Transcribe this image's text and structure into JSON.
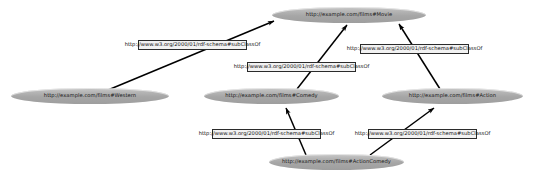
{
  "diagram": {
    "type": "directed-graph",
    "background_color": "#ffffff",
    "node_fill_color": "#a8a8a8",
    "node_text_color": "#1a1a1a",
    "edge_color": "#000000",
    "edge_label_fill": "#f2f2f2",
    "edge_label_border": "#2b2b2b",
    "nodes": [
      {
        "id": "movie",
        "label": "http://example.com/films#Movie"
      },
      {
        "id": "western",
        "label": "http://example.com/films#Western"
      },
      {
        "id": "comedy",
        "label": "http://example.com/films#Comedy"
      },
      {
        "id": "action",
        "label": "http://example.com/films#Action"
      },
      {
        "id": "actioncomedy",
        "label": "http://example.com/films#ActionComedy"
      }
    ],
    "edges": [
      {
        "id": "western-movie",
        "from": "western",
        "to": "movie",
        "label": "http://www.w3.org/2000/01/rdf-schema#subClassOf"
      },
      {
        "id": "comedy-movie",
        "from": "comedy",
        "to": "movie",
        "label": "http://www.w3.org/2000/01/rdf-schema#subClassOf"
      },
      {
        "id": "action-movie",
        "from": "action",
        "to": "movie",
        "label": "http://www.w3.org/2000/01/rdf-schema#subClassOf"
      },
      {
        "id": "actioncomedy-comedy",
        "from": "actioncomedy",
        "to": "comedy",
        "label": "http://www.w3.org/2000/01/rdf-schema#subClassOf"
      },
      {
        "id": "actioncomedy-action",
        "from": "actioncomedy",
        "to": "action",
        "label": "http://www.w3.org/2000/01/rdf-schema#subClassOf"
      }
    ]
  }
}
